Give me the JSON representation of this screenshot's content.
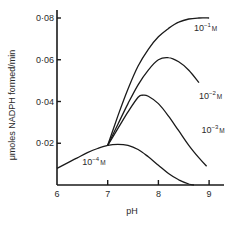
{
  "chart_data": {
    "type": "line",
    "title": "",
    "xlabel": "pH",
    "ylabel": "μmoles NADPH formed/min",
    "xlim": [
      6,
      9.3
    ],
    "ylim": [
      0,
      0.08
    ],
    "grid": false,
    "legend": "inline labels",
    "x_ticks": [
      6,
      7,
      8,
      9
    ],
    "x_tick_labels": [
      "6",
      "7",
      "8",
      "9"
    ],
    "y_ticks": [
      0.02,
      0.04,
      0.06,
      0.08
    ],
    "y_tick_labels": [
      "0·02",
      "0·04",
      "0·06",
      "0·08"
    ],
    "series": [
      {
        "name": "10⁻¹M",
        "label_base": "10",
        "label_exp": "−1",
        "label_unit": "M",
        "label_pos": [
          8.7,
          0.074
        ],
        "x": [
          7.0,
          7.2,
          7.4,
          7.6,
          7.8,
          8.0,
          8.2,
          8.4,
          8.6,
          8.8,
          9.0
        ],
        "values": [
          0.019,
          0.033,
          0.046,
          0.057,
          0.065,
          0.071,
          0.075,
          0.078,
          0.0795,
          0.08,
          0.08
        ]
      },
      {
        "name": "10⁻²M",
        "label_base": "10",
        "label_exp": "−2",
        "label_unit": "M",
        "label_pos": [
          8.8,
          0.041
        ],
        "x": [
          7.0,
          7.2,
          7.4,
          7.6,
          7.8,
          8.0,
          8.2,
          8.4,
          8.6,
          8.8
        ],
        "values": [
          0.019,
          0.029,
          0.039,
          0.048,
          0.055,
          0.06,
          0.061,
          0.059,
          0.055,
          0.049
        ]
      },
      {
        "name": "10⁻³M",
        "label_base": "10",
        "label_exp": "−3",
        "label_unit": "M",
        "label_pos": [
          8.85,
          0.025
        ],
        "x": [
          7.0,
          7.2,
          7.4,
          7.6,
          7.7,
          7.8,
          8.0,
          8.2,
          8.4,
          8.6,
          8.8,
          8.95
        ],
        "values": [
          0.019,
          0.027,
          0.035,
          0.042,
          0.043,
          0.0425,
          0.039,
          0.033,
          0.026,
          0.019,
          0.013,
          0.009
        ]
      },
      {
        "name": "10⁻⁴M",
        "label_base": "10",
        "label_exp": "−4",
        "label_unit": "M",
        "label_pos": [
          6.5,
          0.0095
        ],
        "x": [
          6.0,
          6.2,
          6.4,
          6.6,
          6.8,
          7.0,
          7.2,
          7.4,
          7.6,
          7.8,
          8.0,
          8.2,
          8.4,
          8.6,
          8.7
        ],
        "values": [
          0.008,
          0.0105,
          0.013,
          0.0155,
          0.0175,
          0.019,
          0.0195,
          0.019,
          0.017,
          0.0135,
          0.0095,
          0.0055,
          0.0025,
          0.0005,
          0.0
        ]
      }
    ]
  },
  "layout": {
    "plot_left_px": 57,
    "plot_bottom_px": 185,
    "px_per_ph": 50.7,
    "px_per_unit": 2087.5,
    "x_axis_end_px": 224,
    "y_axis_top_px": 10
  }
}
